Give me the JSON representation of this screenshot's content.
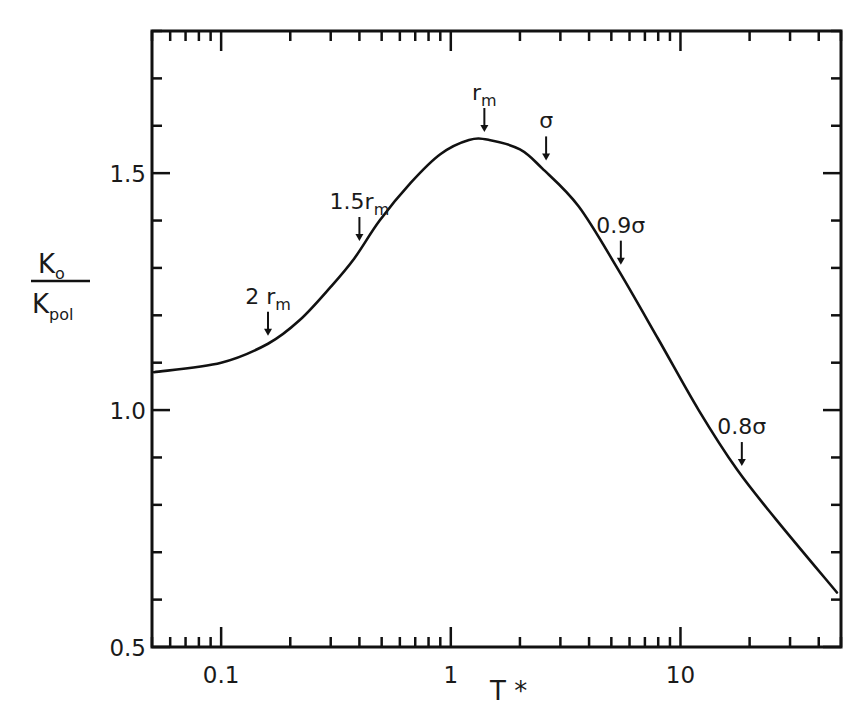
{
  "chart_data": {
    "type": "line",
    "title": "",
    "xlabel": "T *",
    "ylabel": "K_o / K_pol",
    "ylabel_parts": {
      "numerator": "K",
      "numerator_sub": "o",
      "denominator": "K",
      "denominator_sub": "pol"
    },
    "xscale": "log",
    "xlim": [
      0.05,
      50
    ],
    "ylim": [
      0.5,
      1.8
    ],
    "grid": false,
    "legend": null,
    "x_ticks": [
      {
        "value": 0.1,
        "label": "0.1"
      },
      {
        "value": 1,
        "label": "1"
      },
      {
        "value": 10,
        "label": "10"
      }
    ],
    "y_ticks": [
      {
        "value": 0.5,
        "label": "0.5"
      },
      {
        "value": 1.0,
        "label": "1.0"
      },
      {
        "value": 1.5,
        "label": "1.5"
      }
    ],
    "y_minor_step": 0.1,
    "series": [
      {
        "name": "K_o/K_pol",
        "color": "#111111",
        "x": [
          0.051,
          0.1,
          0.16,
          0.22,
          0.3,
          0.38,
          0.49,
          0.67,
          0.9,
          1.2,
          1.47,
          2.0,
          2.5,
          3.6,
          5.3,
          8.0,
          12.0,
          17.6,
          26.0,
          48.0
        ],
        "y": [
          1.08,
          1.1,
          1.14,
          1.19,
          1.26,
          1.32,
          1.4,
          1.48,
          1.54,
          1.57,
          1.57,
          1.55,
          1.51,
          1.43,
          1.3,
          1.15,
          1.0,
          0.875,
          0.77,
          0.615
        ]
      }
    ],
    "annotations": [
      {
        "main": "2 r",
        "sub": "m",
        "x": 0.16,
        "y": 1.14
      },
      {
        "main": "1.5r",
        "sub": "m",
        "x": 0.4,
        "y": 1.34
      },
      {
        "main": "r",
        "sub": "m",
        "x": 1.4,
        "y": 1.57
      },
      {
        "main": "σ",
        "sub": "",
        "x": 2.6,
        "y": 1.51
      },
      {
        "main": "0.9σ",
        "sub": "",
        "x": 5.5,
        "y": 1.29
      },
      {
        "main": "0.8σ",
        "sub": "",
        "x": 18.5,
        "y": 0.865
      }
    ]
  }
}
